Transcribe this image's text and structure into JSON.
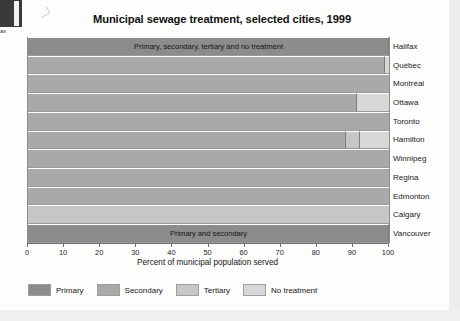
{
  "artifact": {
    "label": "ax"
  },
  "chart_data": {
    "type": "bar",
    "orientation": "horizontal",
    "stacked": true,
    "title": "Municipal sewage treatment, selected cities, 1999",
    "xlabel": "Percent of municipal population served",
    "ylabel": "",
    "xlim": [
      0,
      100
    ],
    "xticks": [
      0,
      10,
      20,
      30,
      40,
      50,
      60,
      70,
      80,
      90,
      100
    ],
    "xtick_labels": [
      "0",
      "10",
      "20",
      "30",
      "40",
      "50",
      "60",
      "70",
      "80",
      "90",
      "100"
    ],
    "grid": false,
    "legend_position": "bottom-left",
    "categories": [
      "Halifax",
      "Québec",
      "Montréal",
      "Ottawa",
      "Toronto",
      "Hamilton",
      "Winnipeg",
      "Regina",
      "Edmonton",
      "Calgary",
      "Vancouver"
    ],
    "series": [
      {
        "name": "Primary",
        "color": "#8c8c8c",
        "values": [
          100,
          0,
          0,
          0,
          0,
          0,
          0,
          0,
          0,
          0,
          100
        ]
      },
      {
        "name": "Secondary",
        "color": "#a9a9a9",
        "values": [
          0,
          99,
          100,
          91,
          100,
          88,
          100,
          100,
          100,
          0,
          0
        ]
      },
      {
        "name": "Tertiary",
        "color": "#c6c6c6",
        "values": [
          0,
          0,
          0,
          0,
          0,
          4,
          0,
          0,
          0,
          100,
          0
        ]
      },
      {
        "name": "No treatment",
        "color": "#d7d7d7",
        "values": [
          0,
          1,
          0,
          9,
          0,
          8,
          0,
          0,
          0,
          0,
          0
        ]
      }
    ],
    "annotations": [
      {
        "category": "Halifax",
        "text": "Primary, secondary, tertiary and no treatment"
      },
      {
        "category": "Vancouver",
        "text": "Primary and secondary"
      }
    ],
    "legend_entries": [
      {
        "label": "Primary",
        "color": "#8c8c8c"
      },
      {
        "label": "Secondary",
        "color": "#a9a9a9"
      },
      {
        "label": "Tertiary",
        "color": "#c6c6c6"
      },
      {
        "label": "No treatment",
        "color": "#d7d7d7"
      }
    ]
  }
}
